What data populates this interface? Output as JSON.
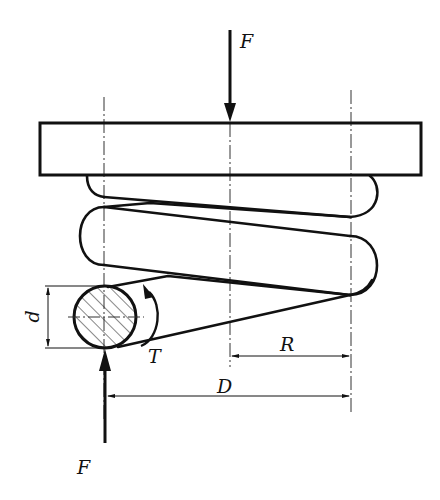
{
  "figure": {
    "colors": {
      "line": "#111111",
      "background": "#ffffff"
    }
  },
  "labels": {
    "force_top": "F",
    "force_bottom": "F",
    "torque": "T",
    "wire_diameter": "d",
    "mean_radius": "R",
    "mean_diameter": "D"
  }
}
